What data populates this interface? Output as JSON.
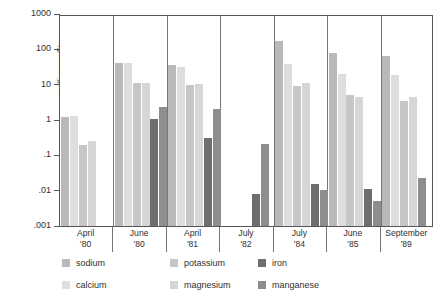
{
  "chart_data": {
    "type": "bar",
    "title": "",
    "subtitle": "",
    "xlabel": "",
    "ylabel": "milligrams/liter",
    "yscale": "log",
    "ylim": [
      0.001,
      1000
    ],
    "ytick_labels": [
      "1000",
      "100",
      "10",
      "1",
      ".1",
      ".01",
      ".001"
    ],
    "ytick_values": [
      1000,
      100,
      10,
      1,
      0.1,
      0.01,
      0.001
    ],
    "grid": false,
    "legend_position": "bottom",
    "categories": [
      "April '80",
      "June '80",
      "April '81",
      "July '82",
      "July '84",
      "June '85",
      "September '89"
    ],
    "category_lines": [
      {
        "month": "April",
        "year": "'80"
      },
      {
        "month": "June",
        "year": "'80"
      },
      {
        "month": "April",
        "year": "'81"
      },
      {
        "month": "July",
        "year": "'82"
      },
      {
        "month": "July",
        "year": "'84"
      },
      {
        "month": "June",
        "year": "'85"
      },
      {
        "month": "September",
        "year": "'89"
      }
    ],
    "series": [
      {
        "name": "sodium",
        "color": "#b9b9b9",
        "values": [
          1.2,
          40,
          37,
          null,
          170,
          78,
          65
        ]
      },
      {
        "name": "calcium",
        "color": "#dedede",
        "values": [
          1.3,
          40,
          31,
          null,
          38,
          20,
          19
        ]
      },
      {
        "name": "potassium",
        "color": "#c6c6c6",
        "values": [
          0.2,
          11.5,
          10,
          null,
          9,
          5.1,
          3.5
        ]
      },
      {
        "name": "magnesium",
        "color": "#d6d6d6",
        "values": [
          0.25,
          11,
          10.5,
          null,
          11,
          4.4,
          4.4
        ]
      },
      {
        "name": "iron",
        "color": "#6e6e6e",
        "values": [
          null,
          1.05,
          0.31,
          0.008,
          0.015,
          0.011,
          null
        ]
      },
      {
        "name": "manganese",
        "color": "#8e8e8e",
        "values": [
          null,
          2.4,
          2.0,
          0.21,
          0.0105,
          0.005,
          0.023
        ]
      }
    ]
  },
  "legend": {
    "items": [
      {
        "label": "sodium",
        "color": "#b9b9b9"
      },
      {
        "label": "potassium",
        "color": "#c6c6c6"
      },
      {
        "label": "iron",
        "color": "#6e6e6e"
      },
      {
        "label": "calcium",
        "color": "#dedede"
      },
      {
        "label": "magnesium",
        "color": "#d6d6d6"
      },
      {
        "label": "manganese",
        "color": "#8e8e8e"
      }
    ]
  }
}
